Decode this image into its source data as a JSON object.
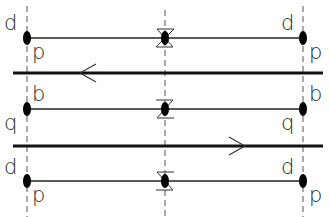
{
  "diagram": {
    "type": "symmetry-strand-diagram",
    "colors": {
      "line": "#111111",
      "dash": "#555555",
      "label": "#222222",
      "background": "#ffffff"
    },
    "columns": [
      {
        "id": "left",
        "x": 27
      },
      {
        "id": "middle",
        "x": 165
      },
      {
        "id": "right",
        "x": 303
      }
    ],
    "rows": [
      {
        "id": "row-1",
        "y": 38,
        "labels": {
          "left_top": "d",
          "left_bottom": "p",
          "right_top": "d",
          "right_bottom": "p"
        },
        "middle_glyph": "hourglass-z"
      },
      {
        "id": "row-2",
        "y": 109,
        "labels": {
          "left_top": "b",
          "left_bottom": "q",
          "right_top": "b",
          "right_bottom": "q"
        },
        "middle_glyph": "hourglass-z-mirrored"
      },
      {
        "id": "row-3",
        "y": 181,
        "labels": {
          "left_top": "d",
          "left_bottom": "p",
          "right_top": "d",
          "right_bottom": "p"
        },
        "middle_glyph": "hourglass-z"
      }
    ],
    "axes": [
      {
        "id": "axis-1",
        "y": 73,
        "arrow_direction": "left",
        "arrow_x": 80
      },
      {
        "id": "axis-2",
        "y": 146,
        "arrow_direction": "right",
        "arrow_x": 245
      }
    ]
  },
  "labels": {
    "r1_lt": "d",
    "r1_lb": "p",
    "r1_rt": "d",
    "r1_rb": "p",
    "r2_lt": "b",
    "r2_lb": "q",
    "r2_rt": "b",
    "r2_rb": "q",
    "r3_lt": "d",
    "r3_lb": "p",
    "r3_rt": "d",
    "r3_rb": "p"
  }
}
